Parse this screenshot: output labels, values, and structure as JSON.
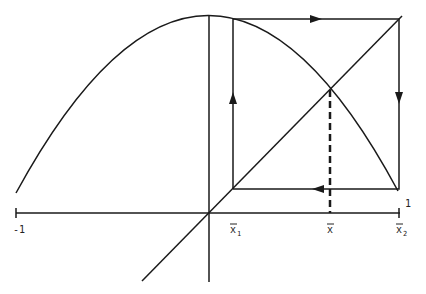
{
  "diagram": {
    "title": "",
    "colors": {
      "ink": "#1a1a1a",
      "background": "#ffffff"
    },
    "axis_labels": {
      "left_end": "-1",
      "right_end": "1",
      "x1": "x",
      "x1_sub": "1",
      "xbar": "x",
      "x2": "x",
      "x2_sub": "2"
    },
    "elements": [
      "parabola-curve",
      "identity-diagonal",
      "horizontal-axis",
      "vertical-axis",
      "cobweb-path",
      "fixed-point-dashed-line"
    ]
  }
}
